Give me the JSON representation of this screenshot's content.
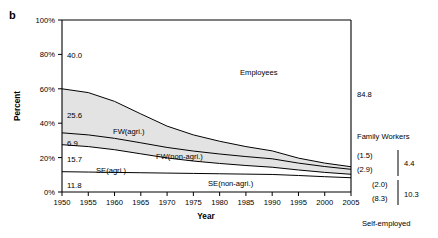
{
  "figure": {
    "panel_letter": "b",
    "ylabel": "Percent",
    "xlabel": "Year"
  },
  "chart_data": {
    "type": "area",
    "title": "",
    "xlabel": "Year",
    "ylabel": "Percent",
    "xlim": [
      1950,
      2005
    ],
    "ylim": [
      0,
      100
    ],
    "grid": false,
    "legend_position": "inline-annotations",
    "x": [
      1950,
      1955,
      1960,
      1965,
      1970,
      1975,
      1980,
      1985,
      1990,
      1995,
      2000,
      2005
    ],
    "xtick_labels": [
      "1950",
      "1955",
      "1960",
      "1965",
      "1970",
      "1975",
      "1980",
      "1985",
      "1990",
      "1995",
      "2000",
      "2005"
    ],
    "ytick_labels": [
      "0%",
      "20%",
      "40%",
      "60%",
      "80%",
      "100%"
    ],
    "ytick_values": [
      0,
      20,
      40,
      60,
      80,
      100
    ],
    "stack_order_bottom_to_top": [
      "SE(non-agri.)",
      "SE(agri.)",
      "FW(non-agri.)",
      "FW(agri.)",
      "Employees"
    ],
    "series": [
      {
        "name": "SE(non-agri.)",
        "label": "SE(non-agri.)",
        "start_value": 11.8,
        "end_value": 8.3,
        "values": [
          11.8,
          11.6,
          11.4,
          11.2,
          11.0,
          10.8,
          10.6,
          10.4,
          10.2,
          9.6,
          8.9,
          8.3
        ]
      },
      {
        "name": "SE(agri.)",
        "label": "SE(agri.)",
        "start_value": 15.7,
        "end_value": 2.0,
        "values": [
          15.7,
          14.8,
          13.2,
          11.0,
          8.8,
          7.2,
          6.0,
          5.0,
          4.2,
          3.2,
          2.5,
          2.0
        ]
      },
      {
        "name": "FW(non-agri.)",
        "label": "FW(non-agri.)",
        "start_value": 6.9,
        "end_value": 2.9,
        "values": [
          6.9,
          6.8,
          6.6,
          6.4,
          6.1,
          5.8,
          5.5,
          5.2,
          4.9,
          4.0,
          3.4,
          2.9
        ]
      },
      {
        "name": "FW(agri.)",
        "label": "FW(agri.)",
        "start_value": 25.6,
        "end_value": 1.5,
        "values": [
          25.6,
          24.6,
          21.5,
          16.8,
          12.4,
          9.4,
          7.4,
          5.8,
          4.6,
          2.9,
          2.0,
          1.5
        ]
      },
      {
        "name": "Employees",
        "label": "Employees",
        "start_value": 40.0,
        "end_value": 84.8,
        "values": [
          40.0,
          42.2,
          47.3,
          54.6,
          61.7,
          66.8,
          70.5,
          73.6,
          76.1,
          80.3,
          83.2,
          84.8
        ]
      }
    ],
    "left_value_labels": [
      {
        "text": "40.0",
        "series": "Employees"
      },
      {
        "text": "25.6",
        "series": "FW(agri.)"
      },
      {
        "text": "6.9",
        "series": "FW(non-agri.)"
      },
      {
        "text": "15.7",
        "series": "SE(agri.)"
      },
      {
        "text": "11.8",
        "series": "SE(non-agri.)"
      }
    ],
    "right_value_labels": [
      {
        "text": "84.8",
        "series": "Employees"
      },
      {
        "text": "(1.5)",
        "series": "FW(agri.)"
      },
      {
        "text": "(2.9)",
        "series": "FW(non-agri.)"
      },
      {
        "text": "(2.0)",
        "series": "SE(agri.)"
      },
      {
        "text": "(8.3)",
        "series": "SE(non-agri.)"
      }
    ],
    "right_groups": [
      {
        "name": "Family Workers",
        "total": "4.4"
      },
      {
        "name": "Self-employed",
        "total": "10.3"
      }
    ],
    "inline_annotations": [
      "Employees",
      "FW(agri.)",
      "FW(non-agri.)",
      "SE(agri.)",
      "SE(non-agri.)"
    ]
  }
}
